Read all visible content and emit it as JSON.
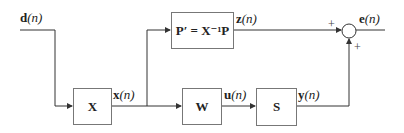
{
  "diagram": {
    "type": "block-diagram",
    "signals": {
      "input": {
        "symbol": "d",
        "arg": "(n)"
      },
      "x_out": {
        "symbol": "x",
        "arg": "(n)"
      },
      "z_out": {
        "symbol": "z",
        "arg": "(n)"
      },
      "u_out": {
        "symbol": "u",
        "arg": "(n)"
      },
      "y_out": {
        "symbol": "y",
        "arg": "(n)"
      },
      "error": {
        "symbol": "e",
        "arg": "(n)"
      }
    },
    "blocks": {
      "X": {
        "label": "X"
      },
      "P": {
        "label": "P′ = X⁻¹P"
      },
      "W": {
        "label": "W"
      },
      "S": {
        "label": "S"
      }
    },
    "summing_junction": {
      "top_sign": "+",
      "bottom_sign": "+"
    },
    "colors": {
      "line": "#333333",
      "box_border": "#777777",
      "text": "#222222"
    }
  }
}
